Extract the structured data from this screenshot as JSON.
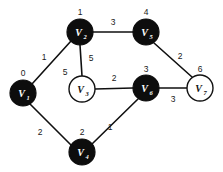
{
  "figure": {
    "background_color": "#ffffff",
    "width": 223,
    "height": 172
  },
  "style": {
    "node_fill_visited": "#0d0d0d",
    "node_fill_unvisited": "#ffffff",
    "node_stroke": "#131313",
    "node_text_on_dark": "#ffffff",
    "node_text_on_light": "#111111",
    "edge_color": "#101010",
    "label_color": "#1a1a1a"
  },
  "chart_data": {
    "type": "diagram",
    "title": "",
    "xlabel": "",
    "ylabel": "",
    "graph_kind": "weighted undirected graph",
    "node_count": 7,
    "edge_count": 8,
    "nodes": [
      {
        "id": "v1",
        "base": "V",
        "subscript": "1",
        "index_label": "0",
        "fill": "filled",
        "cx": 23,
        "cy": 93,
        "r": 13,
        "index_x": 23,
        "index_y": 73
      },
      {
        "id": "v2",
        "base": "V",
        "subscript": "2",
        "index_label": "1",
        "fill": "filled",
        "cx": 80,
        "cy": 32,
        "r": 13,
        "index_x": 80,
        "index_y": 12
      },
      {
        "id": "v3",
        "base": "V",
        "subscript": "3",
        "index_label": "5",
        "fill": "open",
        "cx": 82,
        "cy": 89,
        "r": 13,
        "index_x": 65,
        "index_y": 72
      },
      {
        "id": "v4",
        "base": "V",
        "subscript": "4",
        "index_label": "2",
        "fill": "filled",
        "cx": 82,
        "cy": 152,
        "r": 13,
        "index_x": 82,
        "index_y": 132
      },
      {
        "id": "v5",
        "base": "V",
        "subscript": "5",
        "index_label": "4",
        "fill": "filled",
        "cx": 146,
        "cy": 32,
        "r": 13,
        "index_x": 146,
        "index_y": 12
      },
      {
        "id": "v6",
        "base": "V",
        "subscript": "6",
        "index_label": "3",
        "fill": "filled",
        "cx": 146,
        "cy": 88,
        "r": 13,
        "index_x": 146,
        "index_y": 69
      },
      {
        "id": "v7",
        "base": "V",
        "subscript": "7",
        "index_label": "6",
        "fill": "open",
        "cx": 200,
        "cy": 88,
        "r": 13,
        "index_x": 200,
        "index_y": 69
      }
    ],
    "edges": [
      {
        "id": "e-v1-v2",
        "from": "v1",
        "to": "v2",
        "weight": "1",
        "x1": 32,
        "y1": 84,
        "x2": 71,
        "y2": 41,
        "wx": 44,
        "wy": 57
      },
      {
        "id": "e-v1-v4",
        "from": "v1",
        "to": "v4",
        "weight": "2",
        "x1": 30,
        "y1": 104,
        "x2": 71,
        "y2": 145,
        "wx": 40,
        "wy": 132
      },
      {
        "id": "e-v2-v3",
        "from": "v2",
        "to": "v3",
        "weight": "5",
        "x1": 80,
        "y1": 45,
        "x2": 82,
        "y2": 76,
        "wx": 91,
        "wy": 58
      },
      {
        "id": "e-v2-v5",
        "from": "v2",
        "to": "v5",
        "weight": "3",
        "x1": 93,
        "y1": 32,
        "x2": 133,
        "y2": 32,
        "wx": 113,
        "wy": 22
      },
      {
        "id": "e-v3-v6",
        "from": "v3",
        "to": "v6",
        "weight": "2",
        "x1": 95,
        "y1": 89,
        "x2": 133,
        "y2": 88,
        "wx": 114,
        "wy": 78
      },
      {
        "id": "e-v4-v6",
        "from": "v4",
        "to": "v6",
        "weight": "1",
        "x1": 92,
        "y1": 144,
        "x2": 138,
        "y2": 99,
        "wx": 110,
        "wy": 127
      },
      {
        "id": "e-v5-v7",
        "from": "v5",
        "to": "v7",
        "weight": "2",
        "x1": 154,
        "y1": 43,
        "x2": 192,
        "y2": 77,
        "wx": 180,
        "wy": 56
      },
      {
        "id": "e-v6-v7",
        "from": "v6",
        "to": "v7",
        "weight": "3",
        "x1": 159,
        "y1": 88,
        "x2": 187,
        "y2": 88,
        "wx": 173,
        "wy": 99
      }
    ]
  }
}
